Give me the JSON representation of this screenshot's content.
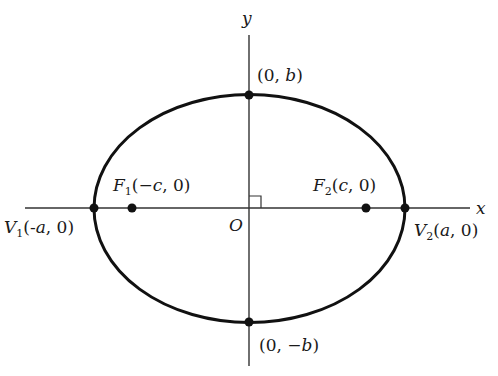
{
  "diagram": {
    "title": "",
    "type": "ellipse-with-foci",
    "colors": {
      "stroke": "#111111",
      "axis": "#333333",
      "background": "#ffffff"
    },
    "axes": {
      "x_label": "x",
      "y_label": "y",
      "origin_label": "O"
    },
    "points": {
      "top_vertex": {
        "label": "(0, b)",
        "parts": [
          "(0, ",
          "b",
          ")"
        ]
      },
      "bottom_vertex": {
        "label": "(0, −b)",
        "parts": [
          "(0, −",
          "b",
          ")"
        ]
      },
      "left_vertex": {
        "label": "V1(-a, 0)",
        "name": "V",
        "sub": "1",
        "parts": [
          "(-",
          "a",
          ", 0)"
        ]
      },
      "right_vertex": {
        "label": "V2(a, 0)",
        "name": "V",
        "sub": "2",
        "parts": [
          "(",
          "a",
          ", 0)"
        ]
      },
      "left_focus": {
        "label": "F1(−c, 0)",
        "name": "F",
        "sub": "1",
        "parts": [
          "(−",
          "c",
          ", 0)"
        ]
      },
      "right_focus": {
        "label": "F2(c, 0)",
        "name": "F",
        "sub": "2",
        "parts": [
          "(",
          "c",
          ", 0)"
        ]
      }
    },
    "annotations": [
      "right-angle mark at origin"
    ]
  }
}
